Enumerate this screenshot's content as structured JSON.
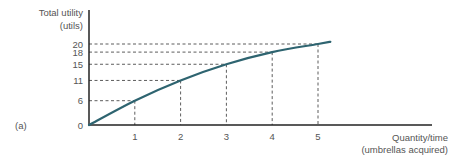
{
  "chart_data": {
    "type": "line",
    "panel_label": "(a)",
    "title": "",
    "ylabel": [
      "Total utility",
      "(utils)"
    ],
    "xlabel": [
      "Quantity/time",
      "(umbrellas acquired)"
    ],
    "x": [
      0,
      1,
      2,
      3,
      4,
      5
    ],
    "x_tick_labels": [
      "1",
      "2",
      "3",
      "4",
      "5"
    ],
    "y_tick_labels": [
      "0",
      "6",
      "11",
      "15",
      "18",
      "20"
    ],
    "series": [
      {
        "name": "Total utility",
        "values": [
          0,
          6,
          11,
          15,
          18,
          20
        ],
        "color": "#2e6470"
      }
    ],
    "xlim": [
      0,
      7.5
    ],
    "ylim": [
      0,
      20
    ],
    "grid": false,
    "dashed_guides": true,
    "legend": "none"
  }
}
